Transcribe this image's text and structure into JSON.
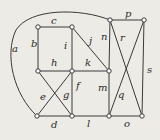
{
  "diagram": {
    "type": "graph",
    "colors": {
      "background": "#ecebe6",
      "edge": "#3a3a3a",
      "vertex_fill": "#ffffff"
    },
    "vertices": [
      {
        "id": "v1",
        "x": 38,
        "y": 27
      },
      {
        "id": "v2",
        "x": 72,
        "y": 27
      },
      {
        "id": "v3",
        "x": 38,
        "y": 71
      },
      {
        "id": "v4",
        "x": 72,
        "y": 71
      },
      {
        "id": "v5",
        "x": 37,
        "y": 116
      },
      {
        "id": "v6",
        "x": 72,
        "y": 116
      },
      {
        "id": "v7",
        "x": 110,
        "y": 20
      },
      {
        "id": "v8",
        "x": 144,
        "y": 20
      },
      {
        "id": "v9",
        "x": 109,
        "y": 71
      },
      {
        "id": "v10",
        "x": 109,
        "y": 116
      },
      {
        "id": "v11",
        "x": 142,
        "y": 116
      }
    ],
    "edges": [
      {
        "label": "a",
        "from": "v7",
        "to": "v5",
        "curve": true
      },
      {
        "label": "b",
        "from": "v1",
        "to": "v3"
      },
      {
        "label": "c",
        "from": "v1",
        "to": "v2"
      },
      {
        "label": "d",
        "from": "v5",
        "to": "v6"
      },
      {
        "label": "e",
        "from": "v5",
        "to": "v4"
      },
      {
        "label": "f",
        "from": "v4",
        "to": "v6"
      },
      {
        "label": "g",
        "from": "v3",
        "to": "v6"
      },
      {
        "label": "h",
        "from": "v3",
        "to": "v4"
      },
      {
        "label": "i",
        "from": "v2",
        "to": "v4"
      },
      {
        "label": "j",
        "from": "v2",
        "to": "v9"
      },
      {
        "label": "k",
        "from": "v4",
        "to": "v9"
      },
      {
        "label": "l",
        "from": "v6",
        "to": "v10"
      },
      {
        "label": "m",
        "from": "v9",
        "to": "v10"
      },
      {
        "label": "n",
        "from": "v7",
        "to": "v9"
      },
      {
        "label": "o",
        "from": "v10",
        "to": "v11"
      },
      {
        "label": "p",
        "from": "v7",
        "to": "v8"
      },
      {
        "label": "q",
        "from": "v10",
        "to": "v8"
      },
      {
        "label": "r",
        "from": "v7",
        "to": "v11"
      },
      {
        "label": "s",
        "from": "v8",
        "to": "v11"
      }
    ],
    "labels": [
      {
        "text": "a",
        "x": 12,
        "y": 52
      },
      {
        "text": "b",
        "x": 31,
        "y": 47
      },
      {
        "text": "c",
        "x": 51,
        "y": 24
      },
      {
        "text": "d",
        "x": 51,
        "y": 128
      },
      {
        "text": "e",
        "x": 40,
        "y": 100
      },
      {
        "text": "f",
        "x": 76,
        "y": 89
      },
      {
        "text": "g",
        "x": 63,
        "y": 98
      },
      {
        "text": "h",
        "x": 51,
        "y": 66
      },
      {
        "text": "i",
        "x": 64,
        "y": 49
      },
      {
        "text": "j",
        "x": 89,
        "y": 44
      },
      {
        "text": "k",
        "x": 85,
        "y": 66
      },
      {
        "text": "l",
        "x": 87,
        "y": 127
      },
      {
        "text": "m",
        "x": 98,
        "y": 91
      },
      {
        "text": "n",
        "x": 101,
        "y": 40
      },
      {
        "text": "o",
        "x": 124,
        "y": 127
      },
      {
        "text": "p",
        "x": 125,
        "y": 17
      },
      {
        "text": "q",
        "x": 118,
        "y": 98
      },
      {
        "text": "r",
        "x": 120,
        "y": 41
      },
      {
        "text": "s",
        "x": 147,
        "y": 73
      }
    ]
  }
}
